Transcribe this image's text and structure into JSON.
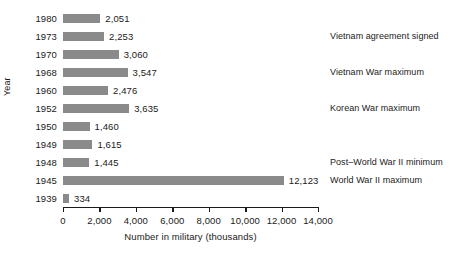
{
  "chart_data": {
    "type": "bar",
    "orientation": "horizontal",
    "title": "",
    "xlabel": "Number in military (thousands)",
    "ylabel": "Year",
    "xlim": [
      0,
      14000
    ],
    "xticks": [
      0,
      2000,
      4000,
      6000,
      8000,
      10000,
      12000,
      14000
    ],
    "xtick_labels": [
      "0",
      "2,000",
      "4,000",
      "6,000",
      "8,000",
      "10,000",
      "12,000",
      "14,000"
    ],
    "grid": false,
    "legend": false,
    "bar_color": "#8a8a8a",
    "categories": [
      "1980",
      "1973",
      "1970",
      "1968",
      "1960",
      "1952",
      "1950",
      "1949",
      "1948",
      "1945",
      "1939"
    ],
    "values": [
      2051,
      2253,
      3060,
      3547,
      2476,
      3635,
      1460,
      1615,
      1445,
      12123,
      334
    ],
    "value_labels": [
      "2,051",
      "2,253",
      "3,060",
      "3,547",
      "2,476",
      "3,635",
      "1,460",
      "1,615",
      "1,445",
      "12,123",
      "334"
    ],
    "annotations": [
      {
        "category": "1973",
        "text": "Vietnam agreement signed"
      },
      {
        "category": "1968",
        "text": "Vietnam War maximum"
      },
      {
        "category": "1952",
        "text": "Korean War maximum"
      },
      {
        "category": "1948",
        "text": "Post–World War II minimum"
      },
      {
        "category": "1945",
        "text": "World War II maximum"
      }
    ]
  }
}
